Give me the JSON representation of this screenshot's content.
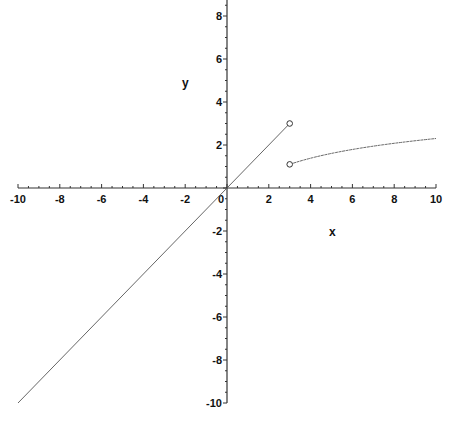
{
  "chart_data": {
    "type": "line",
    "title": "",
    "xlabel": "x",
    "ylabel": "y",
    "xlim": [
      -10,
      10
    ],
    "ylim": [
      -10,
      8.6
    ],
    "grid": false,
    "legend": null,
    "x_ticks": [
      -10,
      -8,
      -6,
      -4,
      -2,
      0,
      2,
      4,
      6,
      8,
      10
    ],
    "y_ticks": [
      -10,
      -8,
      -6,
      -4,
      -2,
      2,
      4,
      6,
      8
    ],
    "x_tick_labels": [
      "-10",
      "-8",
      "-6",
      "-4",
      "-2",
      "0",
      "2",
      "4",
      "6",
      "8",
      "10"
    ],
    "y_tick_labels": [
      "-10",
      "-8",
      "-6",
      "-4",
      "-2",
      "2",
      "4",
      "6",
      "8"
    ],
    "series": [
      {
        "name": "piece 1 (y = x, x < 3)",
        "x": [
          -10,
          -8,
          -6,
          -4,
          -2,
          0,
          2,
          3
        ],
        "y": [
          -10,
          -8,
          -6,
          -4,
          -2,
          0,
          2,
          3
        ],
        "end_marker": "open-circle"
      },
      {
        "name": "piece 2 (y = ln x, x > 3)",
        "x": [
          3,
          4,
          5,
          6,
          7,
          8,
          9,
          10
        ],
        "y": [
          1.1,
          1.39,
          1.61,
          1.79,
          1.95,
          2.08,
          2.2,
          2.3
        ],
        "start_marker": "open-circle"
      }
    ],
    "annotations": [
      {
        "type": "open-circle",
        "x": 3,
        "y": 3
      },
      {
        "type": "open-circle",
        "x": 3,
        "y": 1.1
      }
    ],
    "colors": {
      "axis": "#333333",
      "curve": "#555555",
      "background": "#ffffff"
    }
  }
}
